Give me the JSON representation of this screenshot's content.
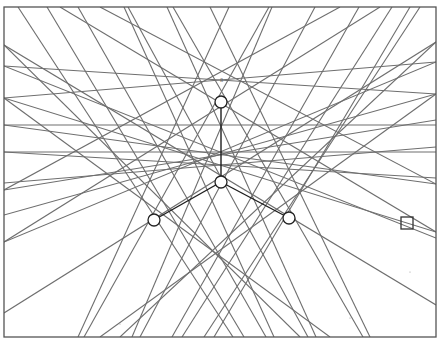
{
  "diagram": {
    "frame": {
      "x": 4,
      "y": 7,
      "width": 432,
      "height": 330
    },
    "colors": {
      "rays": "#6e6e6e",
      "frame": "#555555",
      "links": "#1e1e1e",
      "nodes": "#222222"
    },
    "label": {
      "text": "8",
      "x": 220,
      "y": 82
    },
    "nodes": [
      {
        "id": "top",
        "x": 221,
        "y": 102,
        "r": 6
      },
      {
        "id": "center",
        "x": 221,
        "y": 182,
        "r": 6
      },
      {
        "id": "left",
        "x": 154,
        "y": 220,
        "r": 6
      },
      {
        "id": "right",
        "x": 289,
        "y": 218,
        "r": 6
      }
    ],
    "links": [
      {
        "from": "top",
        "to": "center"
      },
      {
        "from": "center",
        "to": "left"
      },
      {
        "from": "center",
        "to": "right"
      }
    ],
    "square_marker": {
      "x": 401,
      "y": 217,
      "size": 12
    },
    "rays": [
      [
        18,
        7,
        233,
        337
      ],
      [
        47,
        7,
        244,
        337
      ],
      [
        78,
        7,
        266,
        337
      ],
      [
        124,
        7,
        274,
        337
      ],
      [
        128,
        7,
        308,
        337
      ],
      [
        167,
        7,
        316,
        337
      ],
      [
        173,
        7,
        363,
        337
      ],
      [
        210,
        7,
        370,
        337
      ],
      [
        229,
        7,
        78,
        337
      ],
      [
        269,
        7,
        84,
        337
      ],
      [
        272,
        7,
        132,
        337
      ],
      [
        315,
        7,
        140,
        337
      ],
      [
        359,
        7,
        172,
        337
      ],
      [
        392,
        7,
        182,
        337
      ],
      [
        420,
        7,
        204,
        337
      ],
      [
        410,
        7,
        214,
        337
      ],
      [
        4,
        45,
        436,
        305
      ],
      [
        4,
        66,
        436,
        238
      ],
      [
        4,
        98,
        436,
        232
      ],
      [
        4,
        125,
        436,
        184
      ],
      [
        4,
        152,
        436,
        178
      ],
      [
        4,
        183,
        436,
        147
      ],
      [
        4,
        190,
        436,
        120
      ],
      [
        4,
        215,
        436,
        94
      ],
      [
        4,
        242,
        436,
        62
      ],
      [
        4,
        313,
        436,
        42
      ],
      [
        4,
        45,
        300,
        337
      ],
      [
        4,
        98,
        330,
        337
      ],
      [
        436,
        42,
        120,
        337
      ],
      [
        436,
        94,
        100,
        337
      ],
      [
        4,
        125,
        436,
        125
      ],
      [
        4,
        152,
        436,
        152
      ],
      [
        4,
        66,
        436,
        94
      ],
      [
        436,
        62,
        4,
        98
      ],
      [
        60,
        7,
        436,
        232
      ],
      [
        380,
        7,
        4,
        242
      ],
      [
        100,
        7,
        436,
        184
      ],
      [
        340,
        7,
        4,
        190
      ]
    ],
    "specks": [
      {
        "x": 120,
        "y": 324
      },
      {
        "x": 410,
        "y": 272
      },
      {
        "x": 350,
        "y": 318
      }
    ]
  }
}
